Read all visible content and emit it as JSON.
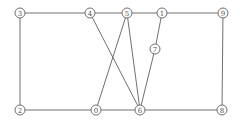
{
  "diagram": {
    "type": "graph",
    "nodes": [
      {
        "id": "3",
        "label": "3",
        "x": 20,
        "y": 13
      },
      {
        "id": "4",
        "label": "4",
        "x": 90,
        "y": 13
      },
      {
        "id": "5",
        "label": "5",
        "x": 127,
        "y": 13
      },
      {
        "id": "1",
        "label": "1",
        "x": 162,
        "y": 13
      },
      {
        "id": "9",
        "label": "9",
        "x": 223,
        "y": 13
      },
      {
        "id": "7",
        "label": "7",
        "x": 155,
        "y": 49
      },
      {
        "id": "2",
        "label": "2",
        "x": 20,
        "y": 110
      },
      {
        "id": "0",
        "label": "0",
        "x": 96,
        "y": 110
      },
      {
        "id": "6",
        "label": "6",
        "x": 140,
        "y": 110
      },
      {
        "id": "8",
        "label": "8",
        "x": 222,
        "y": 110
      }
    ],
    "edges": [
      [
        "3",
        "4"
      ],
      [
        "4",
        "5"
      ],
      [
        "5",
        "1"
      ],
      [
        "1",
        "9"
      ],
      [
        "3",
        "2"
      ],
      [
        "2",
        "0"
      ],
      [
        "0",
        "6"
      ],
      [
        "6",
        "8"
      ],
      [
        "9",
        "8"
      ],
      [
        "4",
        "6"
      ],
      [
        "5",
        "0"
      ],
      [
        "5",
        "6"
      ],
      [
        "1",
        "7"
      ],
      [
        "7",
        "6"
      ]
    ],
    "colors": {
      "stroke": "#707070",
      "label": "#555555",
      "background": "#ffffff"
    }
  }
}
